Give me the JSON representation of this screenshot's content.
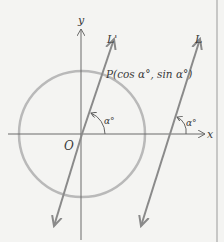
{
  "figure": {
    "axes": {
      "x_label": "x",
      "y_label": "y",
      "origin_label": "O"
    },
    "lines": [
      {
        "name": "L'",
        "label": "L'",
        "passes_through": "O"
      },
      {
        "name": "L",
        "label": "L"
      }
    ],
    "point_label": "P(cos α°, sin α°)",
    "angle_label": "α°",
    "colors": {
      "circle": "#b9b9b9",
      "lines": "#8a8a8a",
      "axes": "#6a6a6a",
      "text": "#3a3a3a",
      "background": "#f4f4f2"
    }
  }
}
